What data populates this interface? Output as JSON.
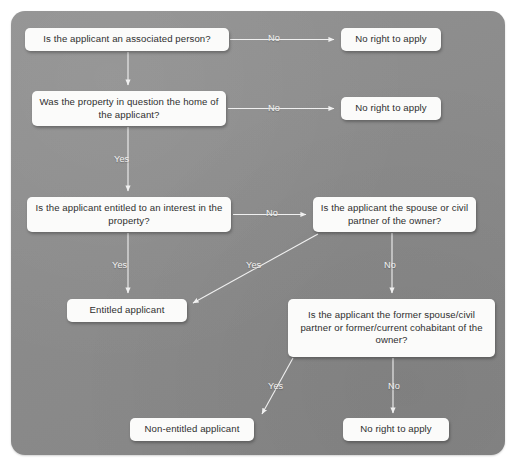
{
  "diagram": {
    "panel": {
      "background_color": "#8c8c8c",
      "corner_radius": "14px"
    },
    "node_style": {
      "fill_color": "#fbfbfa",
      "text_color": "#2f2f2f"
    },
    "connector_color": "#f0f0f0",
    "label_color": "#f2f2f2",
    "nodes": [
      {
        "id": "q-associated-person",
        "type": "decision",
        "text": "Is the applicant an associated person?",
        "x": 25,
        "y": 28,
        "w": 204,
        "h": 23
      },
      {
        "id": "outcome-no-right-1",
        "type": "outcome",
        "text": "No right to apply",
        "x": 341,
        "y": 28,
        "w": 100,
        "h": 23
      },
      {
        "id": "q-home-of-applicant",
        "type": "decision",
        "text": "Was the property in question the home of the applicant?",
        "x": 32,
        "y": 91,
        "w": 194,
        "h": 35
      },
      {
        "id": "outcome-no-right-2",
        "type": "outcome",
        "text": "No right to apply",
        "x": 341,
        "y": 97,
        "w": 100,
        "h": 23
      },
      {
        "id": "q-entitled-interest",
        "type": "decision",
        "text": "Is the applicant entitled to an interest in the property?",
        "x": 27,
        "y": 197,
        "w": 204,
        "h": 35
      },
      {
        "id": "q-spouse-civil-partner",
        "type": "decision",
        "text": "Is the applicant the spouse or civil partner of the owner?",
        "x": 313,
        "y": 197,
        "w": 163,
        "h": 35
      },
      {
        "id": "outcome-entitled-applicant",
        "type": "outcome",
        "text": "Entitled applicant",
        "x": 67,
        "y": 299,
        "w": 120,
        "h": 23
      },
      {
        "id": "q-former-spouse-cohabitant",
        "type": "decision",
        "text": "Is the applicant the former spouse/civil partner or former/current cohabitant of the owner?",
        "x": 288,
        "y": 299,
        "w": 207,
        "h": 58
      },
      {
        "id": "outcome-non-entitled-applicant",
        "type": "outcome",
        "text": "Non-entitled applicant",
        "x": 130,
        "y": 418,
        "w": 124,
        "h": 23
      },
      {
        "id": "outcome-no-right-3",
        "type": "outcome",
        "text": "No right to apply",
        "x": 343,
        "y": 418,
        "w": 106,
        "h": 23
      }
    ],
    "edges": [
      {
        "id": "e-associated-no",
        "from": "q-associated-person",
        "to": "outcome-no-right-1",
        "label": "No",
        "label_x": 268,
        "label_y": 33
      },
      {
        "id": "e-associated-yes",
        "from": "q-associated-person",
        "to": "q-home-of-applicant",
        "label": ""
      },
      {
        "id": "e-home-no",
        "from": "q-home-of-applicant",
        "to": "outcome-no-right-2",
        "label": "No",
        "label_x": 268,
        "label_y": 103
      },
      {
        "id": "e-home-yes",
        "from": "q-home-of-applicant",
        "to": "q-entitled-interest",
        "label": "Yes",
        "label_x": 114,
        "label_y": 154
      },
      {
        "id": "e-interest-no",
        "from": "q-entitled-interest",
        "to": "q-spouse-civil-partner",
        "label": "No",
        "label_x": 266,
        "label_y": 208
      },
      {
        "id": "e-interest-yes",
        "from": "q-entitled-interest",
        "to": "outcome-entitled-applicant",
        "label": "Yes",
        "label_x": 112,
        "label_y": 260
      },
      {
        "id": "e-spouse-yes",
        "from": "q-spouse-civil-partner",
        "to": "outcome-entitled-applicant",
        "label": "Yes",
        "label_x": 246,
        "label_y": 260
      },
      {
        "id": "e-spouse-no",
        "from": "q-spouse-civil-partner",
        "to": "q-former-spouse-cohabitant",
        "label": "No",
        "label_x": 384,
        "label_y": 260
      },
      {
        "id": "e-cohabitant-yes",
        "from": "q-former-spouse-cohabitant",
        "to": "outcome-non-entitled-applicant",
        "label": "Yes",
        "label_x": 268,
        "label_y": 381
      },
      {
        "id": "e-cohabitant-no",
        "from": "q-former-spouse-cohabitant",
        "to": "outcome-no-right-3",
        "label": "No",
        "label_x": 388,
        "label_y": 381
      }
    ]
  }
}
